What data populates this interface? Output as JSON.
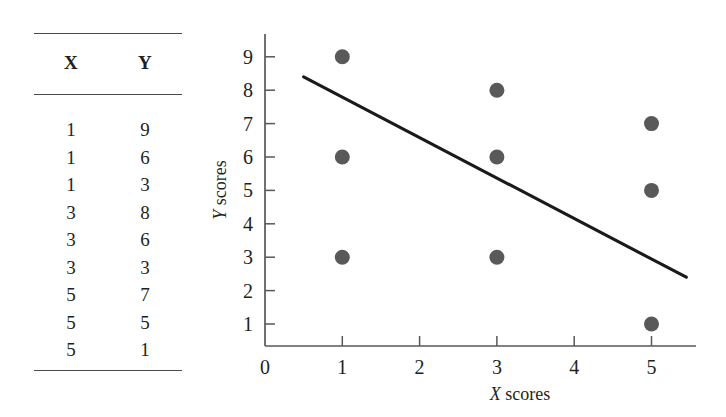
{
  "table": {
    "headers": [
      "X",
      "Y"
    ],
    "rows": [
      [
        "1",
        "9"
      ],
      [
        "1",
        "6"
      ],
      [
        "1",
        "3"
      ],
      [
        "3",
        "8"
      ],
      [
        "3",
        "6"
      ],
      [
        "3",
        "3"
      ],
      [
        "5",
        "7"
      ],
      [
        "5",
        "5"
      ],
      [
        "5",
        "1"
      ]
    ]
  },
  "chart_data": {
    "type": "scatter",
    "title": "",
    "xlabel": "X scores",
    "ylabel": "Y scores",
    "xlabel_italic_prefix": "X",
    "xlabel_rest": " scores",
    "ylabel_italic_prefix": "Y",
    "ylabel_rest": " scores",
    "x": [
      1,
      1,
      1,
      3,
      3,
      3,
      5,
      5,
      5
    ],
    "y": [
      9,
      6,
      3,
      8,
      6,
      3,
      7,
      5,
      1
    ],
    "points": [
      {
        "x": 1,
        "y": 9
      },
      {
        "x": 1,
        "y": 6
      },
      {
        "x": 1,
        "y": 3
      },
      {
        "x": 3,
        "y": 8
      },
      {
        "x": 3,
        "y": 6
      },
      {
        "x": 3,
        "y": 3
      },
      {
        "x": 5,
        "y": 7
      },
      {
        "x": 5,
        "y": 5
      },
      {
        "x": 5,
        "y": 1
      }
    ],
    "xlim": [
      0,
      5.5
    ],
    "ylim": [
      0,
      9.6
    ],
    "xticks": [
      0,
      1,
      2,
      3,
      4,
      5
    ],
    "yticks": [
      1,
      2,
      3,
      4,
      5,
      6,
      7,
      8,
      9
    ],
    "xtick_labels": [
      "0",
      "1",
      "2",
      "3",
      "4",
      "5"
    ],
    "ytick_labels": [
      "1",
      "2",
      "3",
      "4",
      "5",
      "6",
      "7",
      "8",
      "9"
    ],
    "grid": false,
    "legend": null,
    "trendline": {
      "type": "linear",
      "x_start": 0.5,
      "y_start": 8.4,
      "x_end": 5.45,
      "y_end": 2.4,
      "slope": -1.2,
      "intercept": 9.0,
      "color": "#1a1a1a"
    },
    "marker": {
      "shape": "circle",
      "color": "#595959",
      "diameter_px": 15
    }
  }
}
